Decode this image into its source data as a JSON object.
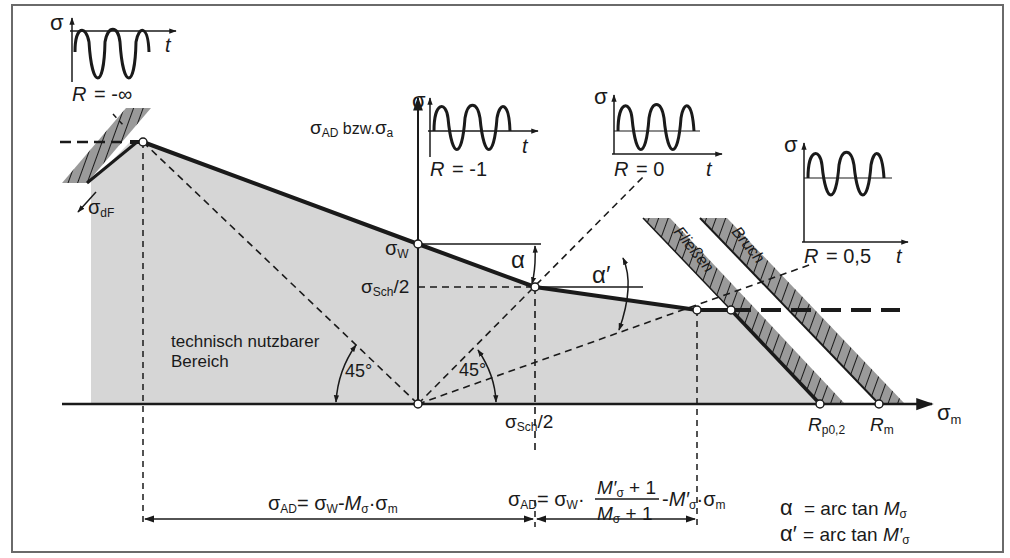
{
  "figure": {
    "type": "Haigh / Smith fatigue strength diagram (Dauerfestigkeitsschaubild)",
    "colors": {
      "frame": "#6a6a6a",
      "ink": "#1a1a1a",
      "usable_area_fill": "#d6d6d6",
      "hatch_band_fill": "#9a9a9a",
      "background": "#ffffff"
    }
  },
  "axes": {
    "y_label_main": "σ",
    "y_label_sub": "AD",
    "y_label_mid": " bzw.",
    "y_label_main2": "σ",
    "y_label_sub2": "a",
    "x_label_main": "σ",
    "x_label_sub": "m"
  },
  "insets": [
    {
      "id": "r-minus-inf",
      "sigma": "σ",
      "t": "t",
      "r_label": "R = -∞"
    },
    {
      "id": "r-minus-1",
      "sigma": "σ",
      "t": "t",
      "r_label": "R = -1"
    },
    {
      "id": "r-zero",
      "sigma": "σ",
      "t": "t",
      "r_label": "R = 0"
    },
    {
      "id": "r-half",
      "sigma": "σ",
      "t": "t",
      "r_label": "R = 0,5"
    }
  ],
  "labels": {
    "sigma_dF": {
      "main": "σ",
      "sub": "dF"
    },
    "sigma_W": {
      "main": "σ",
      "sub": "W"
    },
    "sigma_sch_half_y": {
      "main": "σ",
      "sub": "Sch",
      "suffix": "/2"
    },
    "sigma_sch_half_x": {
      "main": "σ",
      "sub": "Sch",
      "suffix": "/2"
    },
    "alpha": "α",
    "alpha_prime": "α′",
    "angle_45_left": "45°",
    "angle_45_right": "45°",
    "region_line1": "technisch nutzbarer",
    "region_line2": "Bereich",
    "fliessen": "Fließen",
    "bruch": "Bruch",
    "rp02": {
      "main": "R",
      "sub": "p0,2"
    },
    "rm": {
      "main": "R",
      "sub": "m"
    }
  },
  "formulas": {
    "left": {
      "lhs_main": "σ",
      "lhs_sub": "AD",
      "eq": "= ",
      "t1_main": "σ",
      "t1_sub": "W",
      "minus": "-",
      "m": "M",
      "m_sub": "σ",
      "dot": "·",
      "t2_main": "σ",
      "t2_sub": "m"
    },
    "right": {
      "lhs_main": "σ",
      "lhs_sub": "AD",
      "eq": "= ",
      "t1_main": "σ",
      "t1_sub": "W",
      "dot": "·",
      "num": "M′σ + 1",
      "num_m": "M′",
      "num_sub": "σ",
      "num_rest": " + 1",
      "den_m": "M",
      "den_sub": "σ",
      "den_rest": " + 1",
      "minus": "-",
      "m2": "M′",
      "m2_sub": "σ",
      "dot2": "·",
      "t2_main": "σ",
      "t2_sub": "m"
    },
    "alpha_def": {
      "sym": "α",
      "text": " = arc tan ",
      "m": "M",
      "sub": "σ"
    },
    "alpha_prime_def": {
      "sym": "α′",
      "text": " = arc tan ",
      "m": "M′",
      "sub": "σ"
    }
  },
  "key_points": {
    "peak_left": [
      143,
      142
    ],
    "sigma_W": [
      418,
      244
    ],
    "sigma_sch_half": [
      535,
      287
    ],
    "knee": [
      697,
      310
    ],
    "yield_intersect": [
      731,
      310
    ],
    "rp02": [
      820,
      404
    ],
    "rm": [
      879,
      404
    ],
    "origin": [
      418,
      404
    ]
  }
}
